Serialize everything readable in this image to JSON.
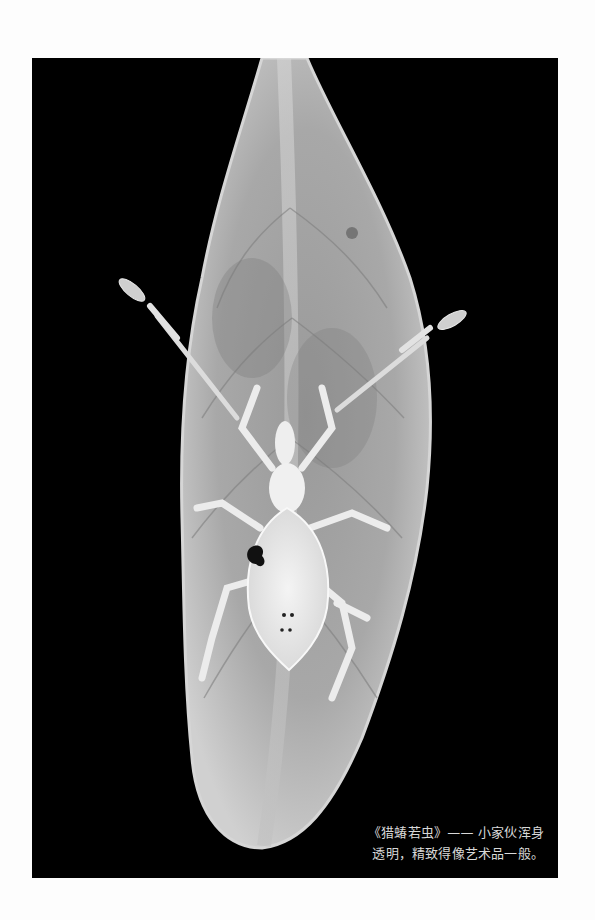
{
  "photo": {
    "subject": "assassin bug nymph on leaf",
    "background_color": "#000000",
    "leaf_color": "#b8b8b8",
    "insect_color": "#eeeeee"
  },
  "caption": {
    "line1": "《猎蝽若虫》—— 小家伙浑身",
    "line2": "透明，精致得像艺术品一般。"
  }
}
